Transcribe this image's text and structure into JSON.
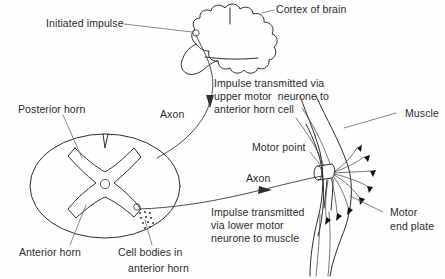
{
  "figure": {
    "background_color": "#fefefe",
    "ink_color": "#2e2e2e"
  },
  "labels": {
    "initiated_impulse": "Initiated impulse",
    "cortex_of_brain": "Cortex of brain",
    "upper_motor_note_line1": "Impulse transmitted via",
    "upper_motor_note_line2": "upper motor  neurone to",
    "upper_motor_note_line3": "anterior horn cell",
    "axon_upper": "Axon",
    "posterior_horn": "Posterior horn",
    "anterior_horn": "Anterior horn",
    "cell_bodies_line1": "Cell bodies in",
    "cell_bodies_line2": "anterior horn",
    "lower_motor_note_line1": "Impulse transmitted",
    "lower_motor_note_line2": "via lower motor",
    "lower_motor_note_line3": "neurone to muscle",
    "axon_lower": "Axon",
    "motor_point": "Motor point",
    "muscle": "Muscle",
    "motor_end_plate_line1": "Motor",
    "motor_end_plate_line2": "end plate"
  },
  "structures": {
    "brain": "cortex-of-brain-outline",
    "spinal_cord": "spinal-cord-cross-section",
    "gray_matter": "butterfly-gray-matter",
    "central_canal": "central-canal",
    "cell_body_cluster": "anterior-horn-cell-bodies",
    "muscle_belly": "muscle-belly-outline",
    "nerve_trunk": "nerve-trunk-cylinder",
    "end_plate_count": 8
  }
}
